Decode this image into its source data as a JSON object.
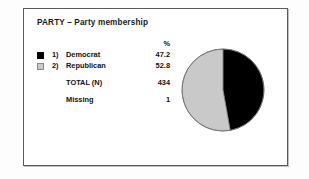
{
  "chart": {
    "title": "PARTY – Party membership",
    "percent_header": "%",
    "rows": [
      {
        "index": "1)",
        "label": "Democrat",
        "value": "47.2",
        "swatch": "black"
      },
      {
        "index": "2)",
        "label": "Republican",
        "value": "52.8",
        "swatch": "gray"
      }
    ],
    "total_label": "TOTAL  (N)",
    "total_value": "434",
    "missing_label": "Missing",
    "missing_value": "1"
  },
  "chart_data": {
    "type": "pie",
    "title": "PARTY – Party membership",
    "categories": [
      "Democrat",
      "Republican"
    ],
    "values": [
      47.2,
      52.8
    ],
    "value_unit": "%",
    "colors": [
      "#000000",
      "#c9c9c9"
    ],
    "total_n": 434,
    "missing": 1,
    "legend_position": "left",
    "start_angle_deg": 0,
    "direction": "clockwise",
    "grid": false,
    "xlabel": "",
    "ylabel": ""
  }
}
